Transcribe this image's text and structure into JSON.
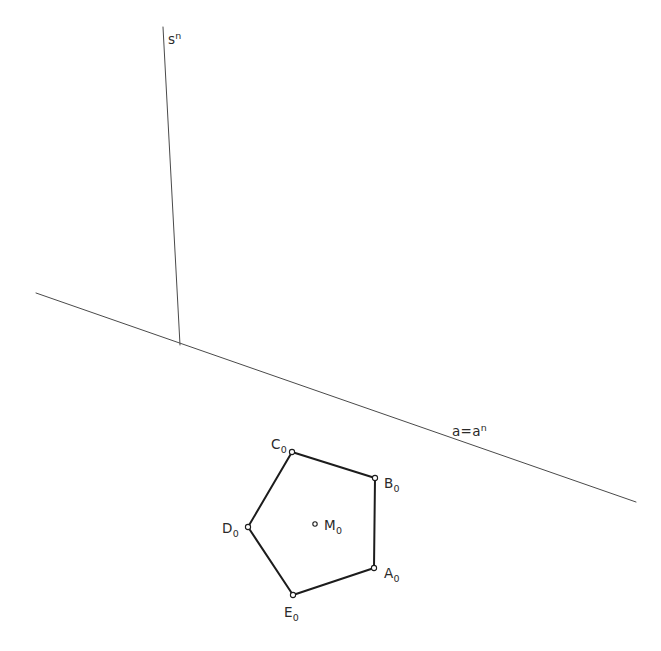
{
  "figure": {
    "width": 661,
    "height": 651,
    "background": "#ffffff",
    "stroke_thin": "#4a4a4a",
    "stroke_thick": "#1c1c1c",
    "marker_stroke": "#1c1c1c",
    "marker_fill": "#ffffff",
    "text_color": "#2a2a2a"
  },
  "construction_lines": [
    {
      "name": "axis-line-s",
      "label_base": "s",
      "label_sup": "n",
      "x1": 163,
      "y1": 27,
      "x2": 180,
      "y2": 345,
      "label_x": 168,
      "label_y": 44,
      "width": 1
    },
    {
      "name": "trace-line-a",
      "label_base": "a=a",
      "label_sup": "n",
      "x1": 36,
      "y1": 293,
      "x2": 636,
      "y2": 502,
      "label_x": 452,
      "label_y": 436,
      "width": 1
    }
  ],
  "polygon": {
    "name": "pentagon-A0B0C0D0E0",
    "closed": true,
    "stroke_width": 2,
    "points": "374,568 375,478 292,452 248,527 293,595",
    "vertices": [
      {
        "id": "A0",
        "base": "A",
        "sub": "0",
        "x": 374,
        "y": 568,
        "label_x": 384,
        "label_y": 578
      },
      {
        "id": "B0",
        "base": "B",
        "sub": "0",
        "x": 375,
        "y": 478,
        "label_x": 384,
        "label_y": 488
      },
      {
        "id": "C0",
        "base": "C",
        "sub": "0",
        "x": 292,
        "y": 452,
        "label_x": 271,
        "label_y": 449
      },
      {
        "id": "D0",
        "base": "D",
        "sub": "0",
        "x": 248,
        "y": 527,
        "label_x": 222,
        "label_y": 533
      },
      {
        "id": "E0",
        "base": "E",
        "sub": "0",
        "x": 293,
        "y": 595,
        "label_x": 284,
        "label_y": 617
      }
    ],
    "center": {
      "id": "M0",
      "base": "M",
      "sub": "0",
      "x": 315,
      "y": 524,
      "label_x": 324,
      "label_y": 530
    }
  },
  "marker": {
    "radius": 2.6,
    "center_radius": 2.2,
    "stroke_width": 1.1
  }
}
